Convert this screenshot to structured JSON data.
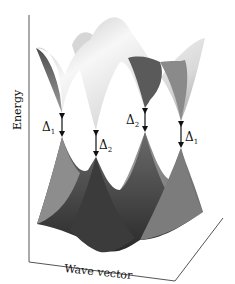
{
  "figure": {
    "type": "3d-band-structure",
    "axes": {
      "vertical_label": "Energy",
      "horizontal_label": "Wave vector"
    },
    "gaps": [
      {
        "symbol": "Δ",
        "subscript": "1",
        "position": "front-left"
      },
      {
        "symbol": "Δ",
        "subscript": "2",
        "position": "front-center-left"
      },
      {
        "symbol": "Δ",
        "subscript": "2",
        "position": "back-center-right"
      },
      {
        "symbol": "Δ",
        "subscript": "1",
        "position": "back-right"
      }
    ],
    "colors": {
      "upper_band_light": "#f4f4f4",
      "upper_band_shadow": "#6a6a6a",
      "lower_band_dark": "#3a3a3a",
      "lower_band_mid": "#8a8a8a",
      "axis": "#555555",
      "arrow": "#111111"
    }
  }
}
